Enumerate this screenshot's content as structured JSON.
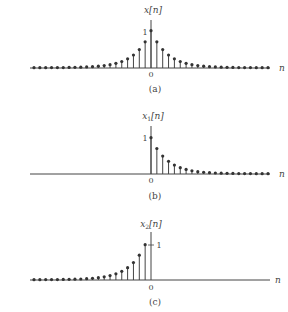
{
  "chart_data": [
    {
      "type": "stem",
      "panel": "a",
      "title": "x[n]",
      "xlabel": "n",
      "caption": "(a)",
      "x_tick": "0",
      "y_tick": "1",
      "n_range": [
        -20,
        20
      ],
      "decay_base": 0.7,
      "description": "two-sided exponential x[n] = a^|n|",
      "x": [
        -20,
        -19,
        -18,
        -17,
        -16,
        -15,
        -14,
        -13,
        -12,
        -11,
        -10,
        -9,
        -8,
        -7,
        -6,
        -5,
        -4,
        -3,
        -2,
        -1,
        0,
        1,
        2,
        3,
        4,
        5,
        6,
        7,
        8,
        9,
        10,
        11,
        12,
        13,
        14,
        15,
        16,
        17,
        18,
        19,
        20
      ],
      "values": [
        0.0008,
        0.0011,
        0.0016,
        0.0023,
        0.0033,
        0.0047,
        0.0068,
        0.0097,
        0.0138,
        0.0198,
        0.0282,
        0.0404,
        0.0576,
        0.0824,
        0.1176,
        0.168,
        0.2401,
        0.343,
        0.49,
        0.7,
        1,
        0.7,
        0.49,
        0.343,
        0.2401,
        0.168,
        0.1176,
        0.0824,
        0.0576,
        0.0404,
        0.0282,
        0.0198,
        0.0138,
        0.0097,
        0.0068,
        0.0047,
        0.0033,
        0.0023,
        0.0016,
        0.0011,
        0.0008
      ]
    },
    {
      "type": "stem",
      "panel": "b",
      "title": "x1[n]",
      "title_main": "x",
      "title_sub": "1",
      "xlabel": "n",
      "caption": "(b)",
      "x_tick": "0",
      "y_tick": "1",
      "n_range": [
        0,
        20
      ],
      "decay_base": 0.7,
      "description": "right-sided exponential x1[n] = a^n u[n]",
      "x": [
        0,
        1,
        2,
        3,
        4,
        5,
        6,
        7,
        8,
        9,
        10,
        11,
        12,
        13,
        14,
        15,
        16,
        17,
        18,
        19,
        20
      ],
      "values": [
        1,
        0.7,
        0.49,
        0.343,
        0.2401,
        0.168,
        0.1176,
        0.0824,
        0.0576,
        0.0404,
        0.0282,
        0.0198,
        0.0138,
        0.0097,
        0.0068,
        0.0047,
        0.0033,
        0.0023,
        0.0016,
        0.0011,
        0.0008
      ]
    },
    {
      "type": "stem",
      "panel": "c",
      "title": "x2[n]",
      "title_main": "x",
      "title_sub": "2",
      "xlabel": "n",
      "caption": "(c)",
      "x_tick": "0",
      "y_tick": "1",
      "n_range": [
        -20,
        -1
      ],
      "decay_base": 0.7,
      "description": "left-sided exponential x2[n] = a^(-n) u[-n-1]",
      "x": [
        -20,
        -19,
        -18,
        -17,
        -16,
        -15,
        -14,
        -13,
        -12,
        -11,
        -10,
        -9,
        -8,
        -7,
        -6,
        -5,
        -4,
        -3,
        -2,
        -1
      ],
      "values": [
        0.0011,
        0.0016,
        0.0023,
        0.0033,
        0.0047,
        0.0068,
        0.0097,
        0.0138,
        0.0198,
        0.0282,
        0.0404,
        0.0576,
        0.0824,
        0.1176,
        0.168,
        0.2401,
        0.343,
        0.49,
        0.7,
        1.0
      ]
    }
  ],
  "panels": {
    "a": {
      "ylabel_main": "x[n]",
      "caption": "(a)",
      "zero": "0",
      "one": "1",
      "n": "n"
    },
    "b": {
      "ylabel_main": "x",
      "ylabel_sub": "1",
      "ylabel_rest": "[n]",
      "caption": "(b)",
      "zero": "0",
      "one": "1",
      "n": "n"
    },
    "c": {
      "ylabel_main": "x",
      "ylabel_sub": "2",
      "ylabel_rest": "[n]",
      "caption": "(c)",
      "zero": "0",
      "one": "1",
      "n": "n"
    }
  }
}
